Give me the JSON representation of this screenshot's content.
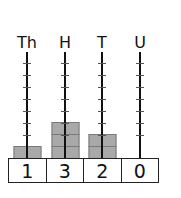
{
  "columns": [
    {
      "label": "Th",
      "digit": "1",
      "blocks": 1,
      "x": 27
    },
    {
      "label": "H",
      "digit": "3",
      "blocks": 3,
      "x": 65
    },
    {
      "label": "T",
      "digit": "2",
      "blocks": 2,
      "x": 102
    },
    {
      "label": "U",
      "digit": "0",
      "blocks": 0,
      "x": 140
    }
  ],
  "number": "1320",
  "colors": {
    "block_fill": "#a9a9a9",
    "block_border": "#7a7a7a",
    "rod": "#111111",
    "text": "#111111"
  }
}
